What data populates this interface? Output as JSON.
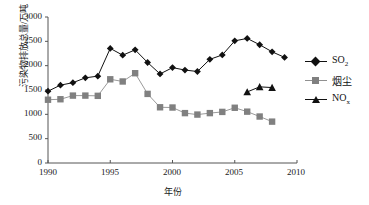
{
  "chart_data": {
    "type": "line",
    "title": "",
    "xlabel": "年份",
    "ylabel": "污染物排放总量/万吨",
    "xlim": [
      1990,
      2010
    ],
    "ylim": [
      0,
      3000
    ],
    "xticks": [
      "1990",
      "1995",
      "2000",
      "2005",
      "2010"
    ],
    "yticks": [
      "0",
      "500",
      "1000",
      "1500",
      "2000",
      "2500",
      "3000"
    ],
    "grid": false,
    "legend_position": "right",
    "series": [
      {
        "name": "SO2",
        "label": "SO",
        "sub": "2",
        "marker": "diamond",
        "color": "#111111",
        "x": [
          1990,
          1991,
          1992,
          1993,
          1994,
          1995,
          1996,
          1997,
          1998,
          1999,
          2000,
          2001,
          2002,
          2003,
          2004,
          2005,
          2006,
          2007,
          2008,
          2009
        ],
        "values": [
          1475,
          1600,
          1650,
          1750,
          1785,
          2355,
          2215,
          2325,
          2065,
          1830,
          1960,
          1910,
          1880,
          2130,
          2220,
          2510,
          2560,
          2430,
          2285,
          2170
        ]
      },
      {
        "name": "烟尘",
        "label": "烟尘",
        "sub": "",
        "marker": "square",
        "color": "#808080",
        "x": [
          1990,
          1991,
          1992,
          1993,
          1994,
          1995,
          1996,
          1997,
          1998,
          1999,
          2000,
          2001,
          2002,
          2003,
          2004,
          2005,
          2006,
          2007,
          2008
        ],
        "values": [
          1300,
          1310,
          1385,
          1385,
          1380,
          1720,
          1675,
          1845,
          1420,
          1145,
          1140,
          1025,
          995,
          1025,
          1050,
          1135,
          1055,
          955,
          850
        ]
      },
      {
        "name": "NOx",
        "label": "NO",
        "sub": "x",
        "marker": "triangle",
        "color": "#111111",
        "x": [
          2006,
          2007,
          2008
        ],
        "values": [
          1460,
          1565,
          1550
        ]
      }
    ]
  },
  "axis": {
    "line_color": "#555555"
  }
}
